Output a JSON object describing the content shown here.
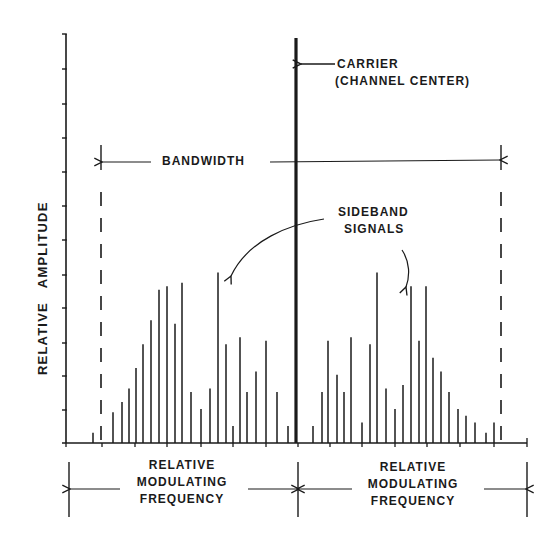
{
  "diagram": {
    "ylabel": "RELATIVE   AMPLITUDE",
    "bandwidth_label": "BANDWIDTH",
    "carrier_label_line1": "CARRIER",
    "carrier_label_line2": "(CHANNEL CENTER)",
    "sideband_label_line1": "SIDEBAND",
    "sideband_label_line2": "SIGNALS",
    "left_freq_label": [
      "RELATIVE",
      "MODULATING",
      "FREQUENCY"
    ],
    "right_freq_label": [
      "RELATIVE",
      "MODULATING",
      "FREQUENCY"
    ],
    "ink_color": "#1a1a1a",
    "background": "#ffffff"
  },
  "geometry": {
    "y_axis": {
      "x": 66,
      "top": 34,
      "bottom": 443,
      "ticks_y": [
        34,
        69,
        104,
        138,
        172,
        206,
        240,
        275,
        308,
        343,
        376,
        410
      ]
    },
    "x_axis": {
      "y": 443,
      "left": 66,
      "right": 527,
      "ticks_x": [
        66,
        102,
        135,
        167,
        201,
        233,
        266,
        298,
        330,
        362,
        395,
        427,
        460,
        494,
        527
      ]
    },
    "carrier": {
      "x": 296,
      "top": 38,
      "bottom": 443
    },
    "bandwidth": {
      "left_x": 101,
      "right_x": 501,
      "arrow_y": 162,
      "bar_top": 145
    },
    "dimension_line": {
      "y": 489,
      "left_x": 69,
      "center_x": 298,
      "right_x": 527,
      "top": 462,
      "bottom": 517
    }
  },
  "chart_data": {
    "type": "bar",
    "title": "",
    "xlabel": "Relative Modulating Frequency",
    "ylabel": "Relative Amplitude",
    "carrier": {
      "x": 296,
      "amplitude": 12
    },
    "left_sidebands": {
      "x": [
        93,
        113,
        122,
        129,
        136,
        143,
        151,
        159,
        167,
        175,
        182,
        191,
        201,
        210,
        218,
        226,
        233,
        240,
        247,
        256,
        266,
        277,
        288
      ],
      "amplitude": [
        0.3,
        0.9,
        1.2,
        1.6,
        2.2,
        2.9,
        3.6,
        4.5,
        4.6,
        3.5,
        4.7,
        1.5,
        1.0,
        1.6,
        5.0,
        2.9,
        0.5,
        3.1,
        1.5,
        2.1,
        3.0,
        1.5,
        0.5
      ]
    },
    "right_sidebands": {
      "x": [
        313,
        322,
        328,
        337,
        344,
        351,
        362,
        370,
        377,
        386,
        395,
        403,
        411,
        419,
        426,
        433,
        441,
        449,
        458,
        466,
        475,
        486,
        494
      ],
      "amplitude": [
        0.5,
        1.5,
        3.0,
        2.0,
        1.5,
        3.1,
        0.6,
        2.9,
        5.0,
        1.6,
        1.0,
        1.7,
        4.6,
        3.0,
        4.6,
        2.5,
        2.1,
        1.5,
        1.0,
        0.8,
        0.6,
        0.3,
        0.6
      ]
    },
    "ylim": [
      0,
      12
    ],
    "grid": false,
    "legend": "none"
  }
}
